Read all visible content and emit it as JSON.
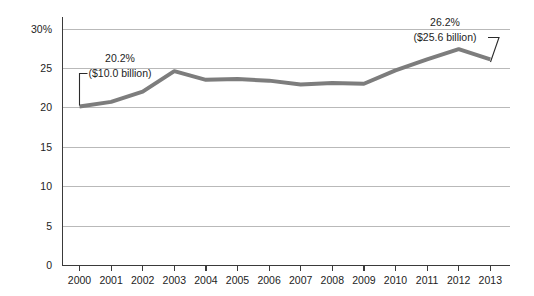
{
  "chart_data": {
    "type": "line",
    "title": "",
    "subtitle": "",
    "xlabel": "",
    "ylabel": "",
    "grid": true,
    "legend": "none",
    "x": [
      "2000",
      "2001",
      "2002",
      "2003",
      "2004",
      "2005",
      "2006",
      "2007",
      "2008",
      "2009",
      "2010",
      "2011",
      "2012",
      "2013"
    ],
    "categories": [
      "2000",
      "2001",
      "2002",
      "2003",
      "2004",
      "2005",
      "2006",
      "2007",
      "2008",
      "2009",
      "2010",
      "2011",
      "2012",
      "2013"
    ],
    "values": [
      20.2,
      20.8,
      22.1,
      24.7,
      23.6,
      23.7,
      23.5,
      23.0,
      23.2,
      23.1,
      24.8,
      26.2,
      27.5,
      26.2
    ],
    "series": [
      {
        "name": "share",
        "values": [
          20.2,
          20.8,
          22.1,
          24.7,
          23.6,
          23.7,
          23.5,
          23.0,
          23.2,
          23.1,
          24.8,
          26.2,
          27.5,
          26.2
        ]
      }
    ],
    "ylim": [
      0,
      30
    ],
    "xlim": [
      "2000",
      "2013"
    ],
    "y_ticks": [
      0,
      5,
      10,
      15,
      20,
      25,
      30
    ],
    "y_tick_labels": [
      "0",
      "5",
      "10",
      "15",
      "20",
      "25",
      "30%"
    ],
    "x_tick_labels": [
      "2000",
      "2001",
      "2002",
      "2003",
      "2004",
      "2005",
      "2006",
      "2007",
      "2008",
      "2009",
      "2010",
      "2011",
      "2012",
      "2013"
    ],
    "annotations": [
      {
        "id": "start-callout",
        "percent": "20.2%",
        "amount": "($10.0 billion)",
        "points_to_year": "2000",
        "points_to_value": 20.2
      },
      {
        "id": "end-callout",
        "percent": "26.2%",
        "amount": "($25.6 billion)",
        "points_to_year": "2013",
        "points_to_value": 26.2
      }
    ],
    "colors": {
      "series_line": "#7d7d7d",
      "gridline": "#b9b9b9",
      "axis": "#3a3a3a",
      "text": "#1d1d1d",
      "background": "#ffffff"
    }
  }
}
